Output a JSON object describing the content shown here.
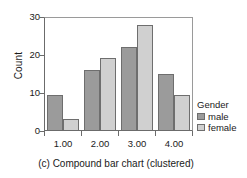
{
  "chart_data": {
    "type": "bar",
    "title": "",
    "caption": "(c) Compound bar chart (clustered)",
    "categories": [
      "1.00",
      "2.00",
      "3.00",
      "4.00"
    ],
    "series": [
      {
        "name": "male",
        "values": [
          9.4,
          16,
          22,
          15
        ],
        "color": "#9b9b9b"
      },
      {
        "name": "female",
        "values": [
          3,
          19,
          28,
          9.3
        ],
        "color": "#d0d0d0"
      }
    ],
    "xlabel": "",
    "ylabel": "Count",
    "ylim": [
      0,
      30
    ],
    "yticks": [
      0,
      10,
      20,
      30
    ],
    "ytick_labels": [
      "0",
      "10",
      "20",
      "30"
    ],
    "grid": false,
    "legend": {
      "title": "Gender",
      "position": "right",
      "entries": [
        "male",
        "female"
      ]
    }
  }
}
